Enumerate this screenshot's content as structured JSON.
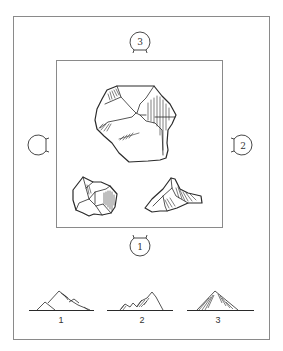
{
  "figure": {
    "type": "rock viewing-direction diagram",
    "outer_frame": {
      "x": 13,
      "y": 16,
      "width": 256,
      "height": 323,
      "stroke": "#8a8a8a"
    },
    "inner_frame": {
      "x": 56,
      "y": 60,
      "width": 166,
      "height": 167,
      "stroke": "#8a8a8a"
    },
    "ink_color": "#2a2a2a",
    "markers": [
      {
        "id": "top",
        "label": "3",
        "cx": 140,
        "cy": 41,
        "opening": "down"
      },
      {
        "id": "right",
        "label": "2",
        "cx": 242,
        "cy": 145,
        "opening": "left"
      },
      {
        "id": "bottom",
        "label": "1",
        "cx": 140,
        "cy": 246,
        "opening": "up"
      },
      {
        "id": "left",
        "label": "",
        "cx": 38,
        "cy": 145,
        "opening": "right"
      }
    ],
    "rocks": [
      {
        "id": "large-rock",
        "position": "center-top"
      },
      {
        "id": "small-rock-left",
        "position": "bottom-left"
      },
      {
        "id": "small-rock-right",
        "position": "bottom-right"
      }
    ],
    "profiles": [
      {
        "label": "1",
        "baseline_x": [
          29,
          94
        ],
        "label_x": 61
      },
      {
        "label": "2",
        "baseline_x": [
          107,
          173
        ],
        "label_x": 142
      },
      {
        "label": "3",
        "baseline_x": [
          187,
          254
        ],
        "label_x": 218
      }
    ]
  }
}
